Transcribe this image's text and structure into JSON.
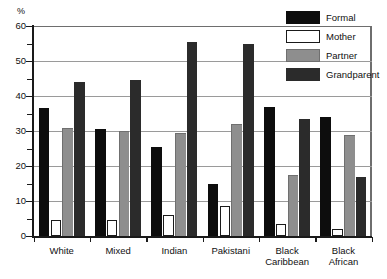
{
  "chart_data": {
    "type": "bar",
    "title": "",
    "xlabel": "",
    "ylabel": "%",
    "ylim": [
      0,
      60
    ],
    "ytick_step": 10,
    "yticks": [
      0,
      10,
      20,
      30,
      40,
      50,
      60
    ],
    "ytick_labels": [
      "0",
      "10",
      "20",
      "30",
      "40",
      "50",
      "60"
    ],
    "minor_tick_step": 5,
    "grid": "horizontal",
    "legend_position": "top-right",
    "categories": [
      "White",
      "Mixed",
      "Indian",
      "Pakistani",
      "Black Caribbean",
      "Black African"
    ],
    "category_labels": [
      "White",
      "Mixed",
      "Indian",
      "Pakistani",
      "Black\nCaribbean",
      "Black\nAfrican"
    ],
    "series": [
      {
        "name": "Formal",
        "color": "#0d0d0d",
        "values": [
          36.5,
          30.5,
          25.5,
          15.0,
          37.0,
          34.0
        ]
      },
      {
        "name": "Mother",
        "color": "#ffffff",
        "values": [
          4.5,
          4.5,
          6.0,
          8.5,
          3.5,
          2.0
        ]
      },
      {
        "name": "Partner",
        "color": "#8e8e8e",
        "values": [
          31.0,
          30.0,
          29.5,
          32.0,
          17.5,
          29.0
        ]
      },
      {
        "name": "Grandparent",
        "color": "#2b2b2b",
        "values": [
          44.0,
          44.5,
          55.5,
          55.0,
          33.5,
          17.0
        ]
      }
    ]
  },
  "legend": {
    "items": [
      {
        "label": "Formal",
        "key": "formal"
      },
      {
        "label": "Mother",
        "key": "mother"
      },
      {
        "label": "Partner",
        "key": "partner"
      },
      {
        "label": "Grandparent",
        "key": "grandparent"
      }
    ]
  },
  "axis": {
    "unit_label": "%"
  }
}
